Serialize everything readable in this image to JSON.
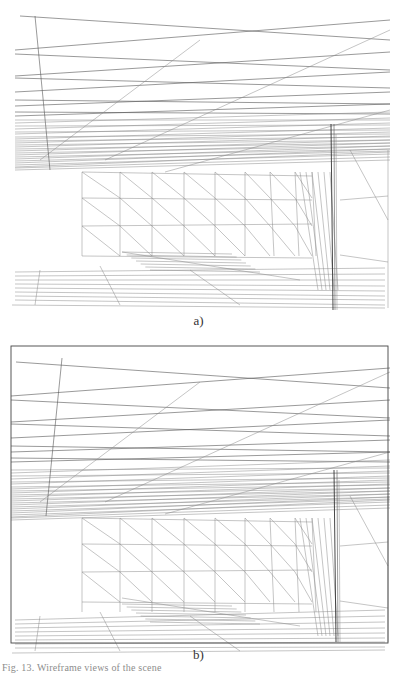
{
  "figure": {
    "panels": [
      {
        "id": "a",
        "label": "a)",
        "has_frame": false,
        "offset_y": 0
      },
      {
        "id": "b",
        "label": "b)",
        "has_frame": true,
        "frame": {
          "x": 11,
          "y": 6,
          "w": 377,
          "h": 297
        },
        "offset_y": 340
      }
    ],
    "caption_fragment": "Fig. 13. Wireframe views of the scene",
    "colors": {
      "line": "#555555",
      "line_light": "#8a8a8a",
      "line_dark": "#333333",
      "background": "#ffffff"
    }
  },
  "geometry": {
    "ceiling_lines": [
      [
        20,
        16,
        390,
        40
      ],
      [
        15,
        50,
        390,
        20
      ],
      [
        15,
        54,
        390,
        70
      ],
      [
        15,
        76,
        390,
        52
      ],
      [
        15,
        78,
        390,
        88
      ],
      [
        15,
        92,
        390,
        72
      ],
      [
        15,
        100,
        390,
        104
      ],
      [
        15,
        106,
        390,
        92
      ],
      [
        15,
        112,
        390,
        114
      ],
      [
        15,
        116,
        390,
        104
      ],
      [
        15,
        120,
        390,
        120
      ],
      [
        15,
        123,
        390,
        112
      ],
      [
        15,
        126,
        390,
        125
      ],
      [
        15,
        129,
        390,
        118
      ],
      [
        15,
        132,
        390,
        130
      ],
      [
        15,
        134,
        390,
        123
      ],
      [
        15,
        137,
        390,
        134
      ],
      [
        15,
        139,
        390,
        128
      ],
      [
        15,
        141,
        390,
        137
      ],
      [
        15,
        143,
        390,
        132
      ],
      [
        15,
        145,
        390,
        140
      ],
      [
        15,
        147,
        390,
        136
      ],
      [
        15,
        149,
        390,
        143
      ],
      [
        15,
        151,
        390,
        140
      ],
      [
        15,
        153,
        390,
        146
      ],
      [
        15,
        155,
        390,
        143
      ],
      [
        15,
        157,
        390,
        149
      ],
      [
        15,
        159,
        390,
        146
      ],
      [
        15,
        161,
        390,
        151
      ],
      [
        15,
        163,
        390,
        149
      ],
      [
        15,
        165,
        390,
        154
      ],
      [
        15,
        167,
        390,
        152
      ],
      [
        15,
        168,
        390,
        157
      ],
      [
        15,
        170,
        390,
        160
      ]
    ],
    "ceiling_diagonals": [
      [
        105,
        160,
        390,
        30
      ],
      [
        165,
        172,
        390,
        110
      ],
      [
        40,
        160,
        200,
        40
      ]
    ],
    "left_post": [
      35,
      16,
      50,
      170
    ],
    "wall_grid": {
      "x_cols": [
        82,
        120,
        152,
        184,
        215,
        245,
        270,
        295,
        312
      ],
      "y_rows_left": [
        172,
        198,
        226,
        256
      ],
      "y_rows_right": [
        176,
        200,
        224,
        258
      ]
    },
    "floor_lines": [
      [
        15,
        272,
        385,
        268
      ],
      [
        15,
        276,
        385,
        274
      ],
      [
        15,
        280,
        385,
        280
      ],
      [
        15,
        284,
        385,
        286
      ],
      [
        15,
        288,
        385,
        291
      ],
      [
        15,
        292,
        385,
        296
      ],
      [
        15,
        296,
        385,
        300
      ],
      [
        15,
        300,
        385,
        305
      ],
      [
        12,
        305,
        385,
        308
      ]
    ],
    "shadow_patch": [
      122,
      252,
      172,
      252,
      200,
      270,
      150,
      270
    ],
    "right_post": {
      "x": 333,
      "top": 124,
      "bottom": 310
    },
    "right_edge": [
      388,
      150,
      388,
      308
    ]
  }
}
